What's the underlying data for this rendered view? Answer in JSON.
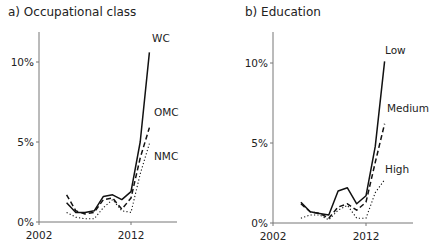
{
  "chart_data": [
    {
      "type": "line",
      "title": "a) Occupational class",
      "xlabel": "",
      "ylabel": "",
      "x": [
        2005,
        2006,
        2007,
        2008,
        2009,
        2010,
        2011,
        2012,
        2013,
        2014
      ],
      "xticks": [
        "2002",
        "2012"
      ],
      "yticks": [
        "0%",
        "5%",
        "10%"
      ],
      "ylim": [
        0,
        12.5
      ],
      "xlim": [
        2002,
        2016
      ],
      "grid": false,
      "legend": "inline labels at line ends",
      "series": [
        {
          "name": "WC",
          "style": "solid",
          "values": [
            1.2,
            0.6,
            0.6,
            0.7,
            1.6,
            1.7,
            1.4,
            1.9,
            5.0,
            10.6
          ]
        },
        {
          "name": "OMC",
          "style": "dashed",
          "values": [
            1.7,
            0.7,
            0.5,
            0.6,
            1.4,
            1.5,
            0.8,
            1.5,
            4.0,
            5.9
          ]
        },
        {
          "name": "NMC",
          "style": "dotted",
          "values": [
            0.6,
            0.3,
            0.2,
            0.2,
            0.9,
            1.4,
            0.7,
            0.6,
            3.0,
            4.9
          ]
        }
      ]
    },
    {
      "type": "line",
      "title": "b) Education",
      "xlabel": "",
      "ylabel": "",
      "x": [
        2005,
        2006,
        2007,
        2008,
        2009,
        2010,
        2011,
        2012,
        2013,
        2014
      ],
      "xticks": [
        "2002",
        "2012"
      ],
      "yticks": [
        "0%",
        "5%",
        "10%"
      ],
      "ylim": [
        0,
        12.5
      ],
      "xlim": [
        2002,
        2016
      ],
      "grid": false,
      "legend": "inline labels at line ends",
      "series": [
        {
          "name": "Low",
          "style": "solid",
          "values": [
            1.3,
            0.7,
            0.6,
            0.5,
            2.0,
            2.2,
            1.2,
            1.7,
            4.8,
            10.1
          ]
        },
        {
          "name": "Medium",
          "style": "dashed",
          "values": [
            1.2,
            0.7,
            0.6,
            0.3,
            1.0,
            1.2,
            0.8,
            1.3,
            3.8,
            6.2
          ]
        },
        {
          "name": "High",
          "style": "dotted",
          "values": [
            0.3,
            0.5,
            0.5,
            0.2,
            0.8,
            1.1,
            0.3,
            0.3,
            1.9,
            2.7
          ]
        }
      ]
    }
  ],
  "panels": {
    "left": {
      "title": "a) Occupational class"
    },
    "right": {
      "title": "b) Education"
    }
  },
  "colors": {
    "axis": "#777777",
    "line": "#111111",
    "text": "#222222"
  }
}
